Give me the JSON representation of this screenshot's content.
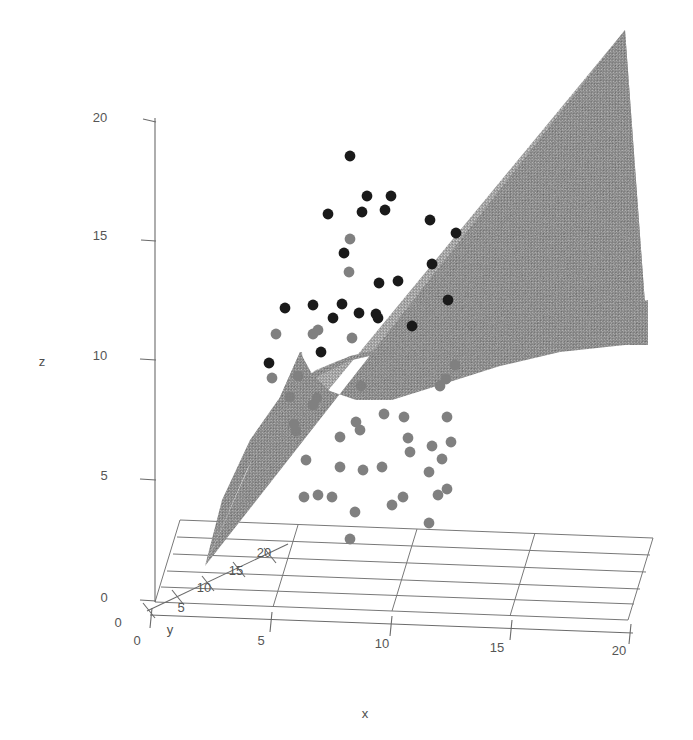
{
  "figure": {
    "kind": "3d-scatter-with-fitted-surface",
    "background_color": "#ffffff",
    "axis_color": "#6b6b6b",
    "grid_color": "#787878",
    "surface_color": "#8e8e8e",
    "surface_color_dark": "#6e6e6e",
    "point_color_high": "#1a1a1a",
    "point_color_low": "#808080"
  },
  "chart_data": {
    "type": "scatter",
    "title": "",
    "xlabel": "x",
    "ylabel": "y",
    "zlabel": "z",
    "xlim": [
      0,
      20
    ],
    "ylim": [
      0,
      20
    ],
    "zlim": [
      0,
      20
    ],
    "xticks": [
      "0",
      "5",
      "10",
      "15",
      "20"
    ],
    "yticks": [
      "0",
      "5",
      "10",
      "15",
      "20"
    ],
    "zticks": [
      "0",
      "5",
      "10",
      "15",
      "20"
    ],
    "grid": true,
    "legend": "none",
    "projection": "3d",
    "surface": {
      "name": "fitted regression surface",
      "description": "monotone increasing surface rising from origin corner and flattening at high x",
      "shading": "dithered gray"
    },
    "series": [
      {
        "name": "observations above surface",
        "color": "#1a1a1a",
        "marker": "circle",
        "points_px": [
          [
            350,
            156
          ],
          [
            367,
            196
          ],
          [
            362,
            212
          ],
          [
            385,
            210
          ],
          [
            391,
            196
          ],
          [
            328,
            214
          ],
          [
            344,
            253
          ],
          [
            313,
            305
          ],
          [
            333,
            318
          ],
          [
            342,
            304
          ],
          [
            321,
            352
          ],
          [
            359,
            313
          ],
          [
            378,
            318
          ],
          [
            398,
            281
          ],
          [
            430,
            220
          ],
          [
            432,
            264
          ],
          [
            376,
            314
          ],
          [
            285,
            308
          ],
          [
            269,
            363
          ],
          [
            412,
            326
          ],
          [
            448,
            300
          ],
          [
            456,
            233
          ],
          [
            379,
            283
          ]
        ]
      },
      {
        "name": "observations below surface",
        "color": "#808080",
        "marker": "circle",
        "points_px": [
          [
            350,
            239
          ],
          [
            349,
            272
          ],
          [
            318,
            330
          ],
          [
            352,
            338
          ],
          [
            313,
            334
          ],
          [
            276,
            334
          ],
          [
            272,
            378
          ],
          [
            313,
            405
          ],
          [
            290,
            397
          ],
          [
            294,
            424
          ],
          [
            296,
            431
          ],
          [
            317,
            398
          ],
          [
            356,
            422
          ],
          [
            360,
            430
          ],
          [
            384,
            414
          ],
          [
            404,
            417
          ],
          [
            408,
            438
          ],
          [
            410,
            452
          ],
          [
            432,
            446
          ],
          [
            429,
            472
          ],
          [
            442,
            459
          ],
          [
            447,
            417
          ],
          [
            440,
            386
          ],
          [
            446,
            379
          ],
          [
            455,
            365
          ],
          [
            438,
            495
          ],
          [
            403,
            497
          ],
          [
            382,
            467
          ],
          [
            363,
            470
          ],
          [
            340,
            467
          ],
          [
            332,
            497
          ],
          [
            318,
            495
          ],
          [
            306,
            460
          ],
          [
            355,
            512
          ],
          [
            392,
            505
          ],
          [
            429,
            523
          ],
          [
            447,
            489
          ],
          [
            451,
            442
          ],
          [
            361,
            386
          ],
          [
            340,
            437
          ],
          [
            304,
            497
          ],
          [
            350,
            539
          ],
          [
            298,
            376
          ]
        ]
      }
    ]
  },
  "axes": {
    "z": {
      "title": "z",
      "ticks": [
        {
          "label": "20",
          "x": 100,
          "y": 122
        },
        {
          "label": "15",
          "x": 100,
          "y": 240
        },
        {
          "label": "10",
          "x": 100,
          "y": 360
        },
        {
          "label": "5",
          "x": 104,
          "y": 480
        },
        {
          "label": "0",
          "x": 104,
          "y": 602
        }
      ],
      "title_pos": {
        "x": 42,
        "y": 366
      }
    },
    "x": {
      "title": "x",
      "ticks": [
        {
          "label": "0",
          "x": 137,
          "y": 645
        },
        {
          "label": "5",
          "x": 261,
          "y": 645
        },
        {
          "label": "10",
          "x": 382,
          "y": 648
        },
        {
          "label": "15",
          "x": 497,
          "y": 652
        },
        {
          "label": "20",
          "x": 619,
          "y": 655
        }
      ],
      "title_pos": {
        "x": 365,
        "y": 718
      }
    },
    "y": {
      "title": "y",
      "ticks": [
        {
          "label": "0",
          "x": 118,
          "y": 627
        },
        {
          "label": "5",
          "x": 181,
          "y": 612
        },
        {
          "label": "10",
          "x": 204,
          "y": 592
        },
        {
          "label": "15",
          "x": 236,
          "y": 575
        },
        {
          "label": "20",
          "x": 264,
          "y": 557
        }
      ],
      "title_pos": {
        "x": 170,
        "y": 634
      }
    }
  }
}
